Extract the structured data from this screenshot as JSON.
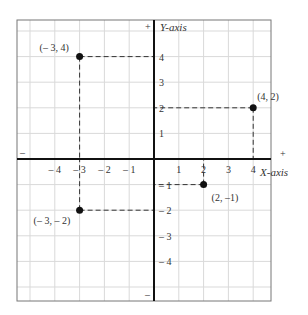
{
  "figure": {
    "x_axis_label": "X-axis",
    "y_axis_label": "Y-axis",
    "plus_sign": "+",
    "minus_sign": "–",
    "x_ticks": [
      {
        "v": -4,
        "label": "– 4"
      },
      {
        "v": -3,
        "label": "– 3"
      },
      {
        "v": -2,
        "label": "– 2"
      },
      {
        "v": -1,
        "label": "– 1"
      },
      {
        "v": 1,
        "label": "1"
      },
      {
        "v": 2,
        "label": "2"
      },
      {
        "v": 3,
        "label": "3"
      },
      {
        "v": 4,
        "label": "4"
      }
    ],
    "y_ticks": [
      {
        "v": 4,
        "label": "4"
      },
      {
        "v": 3,
        "label": "3"
      },
      {
        "v": 2,
        "label": "2"
      },
      {
        "v": 1,
        "label": "1"
      },
      {
        "v": -1,
        "label": "– 1"
      },
      {
        "v": -2,
        "label": "– 2"
      },
      {
        "v": -3,
        "label": "– 3"
      },
      {
        "v": -4,
        "label": "– 4"
      }
    ],
    "points": [
      {
        "x": -3,
        "y": 4,
        "label": "(– 3, 4)"
      },
      {
        "x": 4,
        "y": 2,
        "label": "(4, 2)"
      },
      {
        "x": 2,
        "y": -1,
        "label": "(2, –1)"
      },
      {
        "x": -3,
        "y": -2,
        "label": "(– 3, – 2)"
      }
    ],
    "colors": {
      "grid": "#d9d9d9",
      "axis": "#111111",
      "frame": "#777777",
      "point": "#111111",
      "dash": "#333333"
    }
  }
}
